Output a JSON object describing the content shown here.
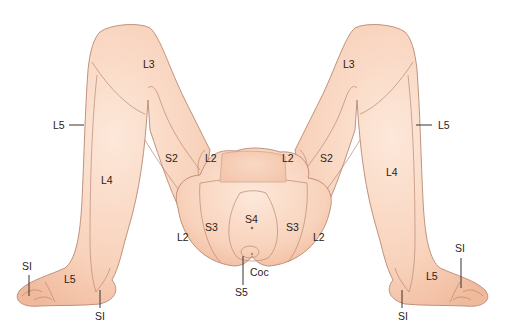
{
  "figure": {
    "colors": {
      "skin_light": "#fbe3d4",
      "skin_mid": "#f6c9ae",
      "skin_dark": "#efb394",
      "outline": "#b98873",
      "label": "#2a2320",
      "background": "#ffffff"
    },
    "labels": {
      "left_thigh_l3": "L3",
      "left_lateral_l5": "L5",
      "left_medial_s2": "S2",
      "left_inner_l2": "L2",
      "left_leg_l4": "L4",
      "left_buttock_l2": "L2",
      "left_s3": "S3",
      "center_s4": "S4",
      "coccyx": "Coc",
      "center_s5": "S5",
      "right_thigh_l3": "L3",
      "right_lateral_l5": "L5",
      "right_medial_s2": "S2",
      "right_inner_l2": "L2",
      "right_leg_l4": "L4",
      "right_buttock_l2": "L2",
      "right_s3": "S3",
      "left_foot_l5": "L5",
      "left_toe_s1": "SI",
      "left_heel_s1": "SI",
      "right_foot_l5": "L5",
      "right_toe_s1": "SI",
      "right_heel_s1": "SI"
    }
  }
}
